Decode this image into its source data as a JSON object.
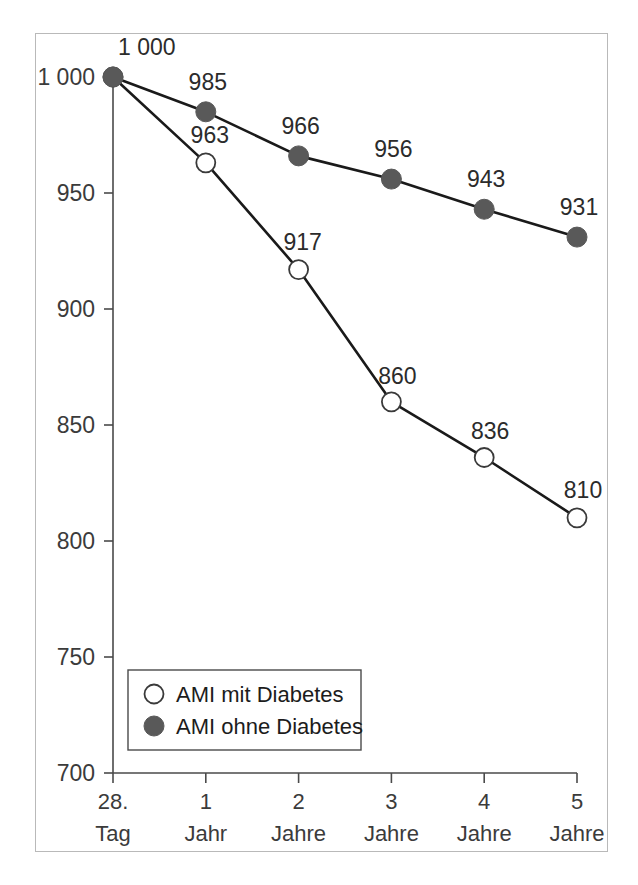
{
  "chart_data": {
    "type": "line",
    "title": "",
    "subtitle": "",
    "xlabel": "",
    "ylabel": "",
    "categories": [
      "28.\nTag",
      "1\nJahr",
      "2\nJahre",
      "3\nJahre",
      "4\nJahre",
      "5\nJahre"
    ],
    "x_tick_labels": [
      {
        "line1": "28.",
        "line2": "Tag"
      },
      {
        "line1": "1",
        "line2": "Jahr"
      },
      {
        "line1": "2",
        "line2": "Jahre"
      },
      {
        "line1": "3",
        "line2": "Jahre"
      },
      {
        "line1": "4",
        "line2": "Jahre"
      },
      {
        "line1": "5",
        "line2": "Jahre"
      }
    ],
    "ylim": [
      700,
      1000
    ],
    "y_ticks": [
      700,
      750,
      800,
      850,
      900,
      950,
      1000
    ],
    "y_tick_labels": [
      "700",
      "750",
      "800",
      "850",
      "900",
      "950",
      "1 000"
    ],
    "grid": false,
    "legend_position": "lower-left-inside",
    "series": [
      {
        "name": "AMI mit Diabetes",
        "marker": "open-circle",
        "marker_fill": "#ffffff",
        "marker_stroke": "#3a3a3a",
        "line_color": "#1a1a1a",
        "values": [
          1000,
          963,
          917,
          860,
          836,
          810
        ],
        "data_labels": [
          "1 000",
          "963",
          "917",
          "860",
          "836",
          "810"
        ]
      },
      {
        "name": "AMI ohne Diabetes",
        "marker": "filled-circle",
        "marker_fill": "#595959",
        "marker_stroke": "#595959",
        "line_color": "#1a1a1a",
        "values": [
          1000,
          985,
          966,
          956,
          943,
          931
        ],
        "data_labels": [
          "1 000",
          "985",
          "966",
          "956",
          "943",
          "931"
        ]
      }
    ]
  },
  "legend": {
    "items": [
      {
        "label": "AMI mit Diabetes",
        "marker": "open-circle"
      },
      {
        "label": "AMI ohne Diabetes",
        "marker": "filled-circle"
      }
    ]
  },
  "colors": {
    "frame_border": "#b9b9b9",
    "axis": "#4a4a4a",
    "line": "#1a1a1a",
    "filled_marker": "#595959",
    "open_marker_fill": "#ffffff",
    "open_marker_stroke": "#3a3a3a",
    "text": "#2b2b2b",
    "background": "#ffffff"
  }
}
